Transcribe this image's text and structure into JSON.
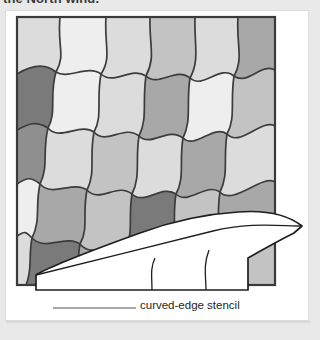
{
  "page": {
    "background_color": "#e9e9e9",
    "panel_color": "#ffffff",
    "running_head": "the North wind."
  },
  "figure": {
    "name": "curved-edge-stencil-diagram",
    "caption": "curved-edge stencil",
    "subject_label": "quilt top with wavy patchwork grid",
    "stencil_label": "curved-edge stencil",
    "leader_line": "callout leader from stencil to caption"
  },
  "quilt": {
    "border_color": "#3a3a3a",
    "seam_color": "#3c3c3c",
    "columns": 6,
    "rows": 6,
    "shades": {
      "light": "#eeeeee",
      "light_mid": "#dcdcdc",
      "mid": "#c3c3c3",
      "mid_dark": "#a8a8a8",
      "dark": "#8f8f8f",
      "darkest": "#7a7a7a"
    },
    "patch_shades": [
      [
        "light_mid",
        "light",
        "light_mid",
        "mid",
        "light_mid",
        "mid_dark"
      ],
      [
        "darkest",
        "light",
        "light_mid",
        "mid_dark",
        "light",
        "mid"
      ],
      [
        "dark",
        "light_mid",
        "mid",
        "light_mid",
        "mid_dark",
        "light_mid"
      ],
      [
        "light",
        "mid_dark",
        "mid",
        "darkest",
        "mid",
        "mid_dark"
      ],
      [
        "light_mid",
        "darkest",
        "mid_dark",
        "mid",
        "light_mid",
        "mid"
      ],
      [
        "mid",
        "light_mid",
        "mid_dark",
        "light_mid",
        "mid",
        "mid_dark"
      ]
    ]
  },
  "stencil": {
    "fill_color": "#ffffff",
    "outline_color": "#1e1e1e",
    "shape": "long tapered wedge with one convex curved edge and three ruled slot lines"
  }
}
